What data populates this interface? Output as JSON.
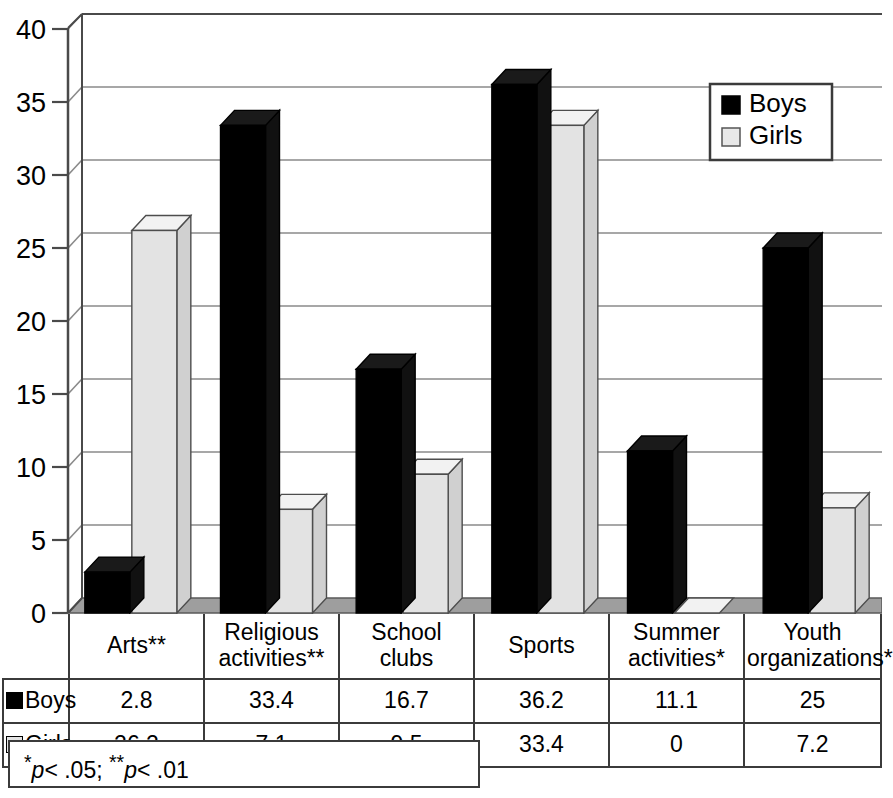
{
  "chart_data": {
    "type": "bar",
    "title": "",
    "xlabel": "",
    "ylabel": "",
    "ylim": [
      0,
      40
    ],
    "ytick_step": 5,
    "yticks": [
      "0",
      "5",
      "10",
      "15",
      "20",
      "25",
      "30",
      "35",
      "40"
    ],
    "grid": true,
    "legend_position": "top-right",
    "style": "3d-column",
    "categories": [
      "Arts**",
      "Religious activities**",
      "School clubs",
      "Sports",
      "Summer activities*",
      "Youth organizations*"
    ],
    "series": [
      {
        "name": "Boys",
        "color": "#000000",
        "values": [
          2.8,
          33.4,
          16.7,
          36.2,
          11.1,
          25
        ]
      },
      {
        "name": "Girls",
        "color": "#e3e3e3",
        "values": [
          26.2,
          7.1,
          9.5,
          33.4,
          0,
          7.2
        ]
      }
    ]
  },
  "legend": {
    "entries": [
      {
        "label": "Boys",
        "swatch": "black-square"
      },
      {
        "label": "Girls",
        "swatch": "white-square"
      }
    ]
  },
  "table": {
    "corner_label": "",
    "column_headers": [
      "Arts**",
      "Religious\nactivities**",
      "School clubs",
      "Sports",
      "Summer\nactivities*",
      "Youth\norganizations*"
    ],
    "column_headers_lines": [
      [
        "Arts**"
      ],
      [
        "Religious",
        "activities**"
      ],
      [
        "School clubs"
      ],
      [
        "Sports"
      ],
      [
        "Summer",
        "activities*"
      ],
      [
        "Youth",
        "organizations*"
      ]
    ],
    "rows": [
      {
        "label": "Boys",
        "swatch": "black-square",
        "values": [
          "2.8",
          "33.4",
          "16.7",
          "36.2",
          "11.1",
          "25"
        ]
      },
      {
        "label": "Girls",
        "swatch": "white-square",
        "values": [
          "26.2",
          "7.1",
          "9.5",
          "33.4",
          "0",
          "7.2"
        ]
      }
    ]
  },
  "footnote": {
    "parts": [
      "*",
      "p",
      "< .05; ",
      "**",
      "p",
      "< .01"
    ],
    "text": "*p< .05; **p< .01"
  },
  "colors": {
    "boys_fill": "#000000",
    "girls_fill": "#e3e3e3",
    "girls_top": "#f2f2f2",
    "girls_side": "#d0d0d0",
    "floor": "#9e9e9e",
    "gridline": "#8a8a8a",
    "axis": "#4a4a4a",
    "border": "#3b3b3b"
  }
}
